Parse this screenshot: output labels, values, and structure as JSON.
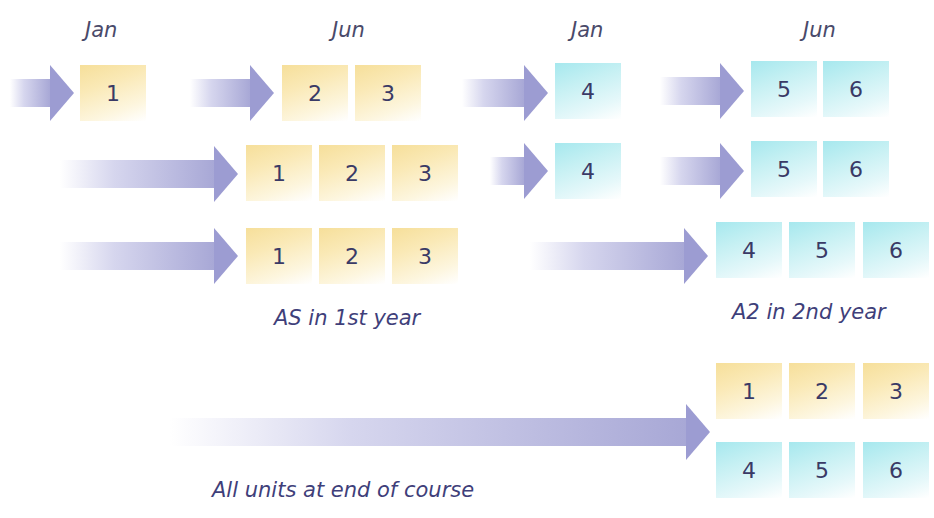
{
  "months": [
    {
      "label": "Jan",
      "x": 85,
      "y": 18
    },
    {
      "label": "Jun",
      "x": 332,
      "y": 18
    },
    {
      "label": "Jan",
      "x": 571,
      "y": 18
    },
    {
      "label": "Jun",
      "x": 803,
      "y": 18
    }
  ],
  "captions": {
    "as_first_year": "AS in 1st year",
    "a2_second_year": "A2 in 2nd year",
    "all_units_end": "All units at end of course"
  },
  "colors": {
    "as_unit": "#f6df9a",
    "a2_unit": "#a6e8ee",
    "arrow": "#9c9cd2",
    "text": "#3a3a66"
  },
  "rows": [
    {
      "name": "modular-staged",
      "arrows": [
        {
          "x": 10,
          "w": 64
        },
        {
          "x": 190,
          "w": 84
        },
        {
          "x": 462,
          "w": 86
        },
        {
          "x": 660,
          "w": 84
        }
      ],
      "units": [
        {
          "label": "1",
          "type": "as",
          "x": 80
        },
        {
          "label": "2",
          "type": "as",
          "x": 282
        },
        {
          "label": "3",
          "type": "as",
          "x": 355
        },
        {
          "label": "4",
          "type": "a2",
          "x": 555
        },
        {
          "label": "5",
          "type": "a2",
          "x": 751
        },
        {
          "label": "6",
          "type": "a2",
          "x": 823
        }
      ]
    },
    {
      "name": "as-june-a2-staged",
      "arrows": [
        {
          "x": 60,
          "w": 178
        },
        {
          "x": 490,
          "w": 58
        },
        {
          "x": 660,
          "w": 84
        }
      ],
      "units": [
        {
          "label": "1",
          "type": "as",
          "x": 246
        },
        {
          "label": "2",
          "type": "as",
          "x": 319
        },
        {
          "label": "3",
          "type": "as",
          "x": 392
        },
        {
          "label": "4",
          "type": "a2",
          "x": 555
        },
        {
          "label": "5",
          "type": "a2",
          "x": 751
        },
        {
          "label": "6",
          "type": "a2",
          "x": 823
        }
      ]
    },
    {
      "name": "as-then-a2",
      "arrows": [
        {
          "x": 60,
          "w": 178
        },
        {
          "x": 530,
          "w": 178
        }
      ],
      "units": [
        {
          "label": "1",
          "type": "as",
          "x": 246
        },
        {
          "label": "2",
          "type": "as",
          "x": 319
        },
        {
          "label": "3",
          "type": "as",
          "x": 392
        },
        {
          "label": "4",
          "type": "a2",
          "x": 716
        },
        {
          "label": "5",
          "type": "a2",
          "x": 789
        },
        {
          "label": "6",
          "type": "a2",
          "x": 863
        }
      ]
    },
    {
      "name": "linear-end-of-course",
      "arrows": [
        {
          "x": 170,
          "w": 540
        }
      ],
      "units_top": [
        {
          "label": "1",
          "type": "as",
          "x": 716
        },
        {
          "label": "2",
          "type": "as",
          "x": 789
        },
        {
          "label": "3",
          "type": "as",
          "x": 863
        }
      ],
      "units_bottom": [
        {
          "label": "4",
          "type": "a2",
          "x": 716
        },
        {
          "label": "5",
          "type": "a2",
          "x": 789
        },
        {
          "label": "6",
          "type": "a2",
          "x": 863
        }
      ]
    }
  ]
}
